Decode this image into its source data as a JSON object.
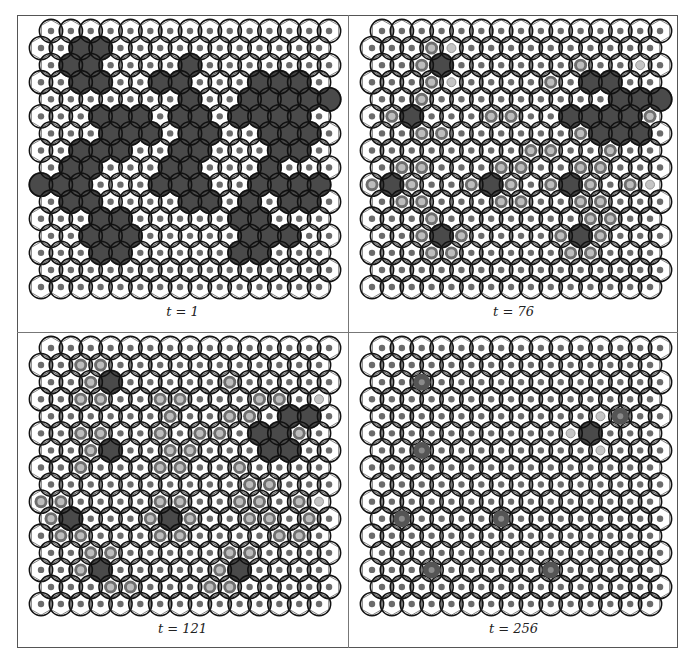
{
  "figure": {
    "panels": [
      {
        "label": "t = 1",
        "rows": [
          "...............",
          "..DD...........",
          ".DD....D.......",
          "..DD..DD...DDD.",
          ".......D..DDDDD",
          "...DDD.DD.DDDD.",
          "...DDD.DD..DDD.",
          "..DDD..DD...DD.",
          ".DD...DD...D...",
          "DDD...DDD..DDDD",
          ".DD....DD.D.DD.",
          "...DD.....DD...",
          "..DDD.....DDD..",
          "...DD.....DD...",
          "...............",
          "..............."
        ]
      },
      {
        "label": "t = 76",
        "rows": [
          "...............",
          "...ro..........",
          "..rD......r..o.",
          "...ro....r.DD..",
          "..r.........DDD",
          ".rD...rr..DDDDr",
          "..rr......rDDD.",
          "........rr..r..",
          ".rr...rr..rr...",
          "rDr..rDr.rDr.ro",
          ".rr...rr..rr...",
          "...r.......rr..",
          "..rDr....rDr...",
          "...rr.....rr...",
          "...............",
          "..............."
        ]
      },
      {
        "label": "t = 121",
        "rows": [
          "...............",
          "..rr...........",
          "..rD.....r.....",
          "..rr..rr...rr.o",
          "......r..rr.DD.",
          "..rr..r.rr.DDr.",
          "..rD..rr...DD..",
          "..r...rr..r....",
          "..........rr...",
          "rr....rr..rr.ro",
          "rD...rDr..rr.r.",
          ".rr...rr....rr.",
          "..rr.....rr....",
          "..rD.....rD....",
          "...rr...rr.....",
          "..............."
        ]
      },
      {
        "label": "t = 256",
        "rows": [
          "...............",
          "...............",
          "..R............",
          "...............",
          "...........oR..",
          "..........oD...",
          "..R........o...",
          "...............",
          "...............",
          "...............",
          ".R....R........",
          "...............",
          "...............",
          "...R.....R.....",
          "...............",
          "..............."
        ]
      }
    ]
  },
  "colors": {
    "dark_fill": "#4a4a4a",
    "cell_outline": "#111111",
    "cell_fill": "#ffffff",
    "dot_normal": "#6b6b6b",
    "dot_light": "#c4c4c4",
    "ring": "#6e6e6e",
    "ring_center": "#bdbdbd"
  }
}
